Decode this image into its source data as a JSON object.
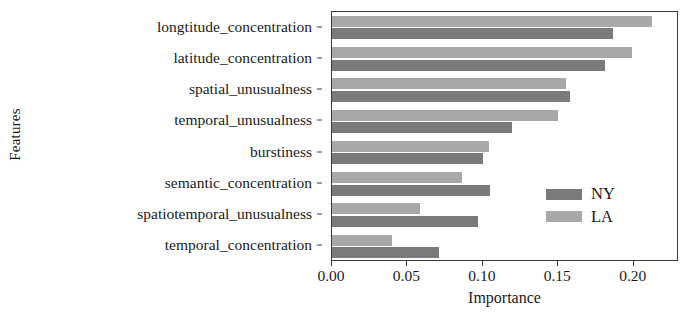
{
  "chart_data": {
    "type": "bar",
    "orientation": "horizontal",
    "title": "",
    "xlabel": "Importance",
    "ylabel": "Features",
    "categories": [
      "longtitude_concentration",
      "latitude_concentration",
      "spatial_unusualness",
      "temporal_unusualness",
      "burstiness",
      "semantic_concentration",
      "spatiotemporal_unusualness",
      "temporal_concentration"
    ],
    "series": [
      {
        "name": "NY",
        "color": "#7a7a7a",
        "values": [
          0.186,
          0.181,
          0.158,
          0.119,
          0.1,
          0.105,
          0.097,
          0.071
        ]
      },
      {
        "name": "LA",
        "color": "#a8a8a8",
        "values": [
          0.212,
          0.199,
          0.155,
          0.15,
          0.104,
          0.086,
          0.058,
          0.04
        ]
      }
    ],
    "xlim": [
      0.0,
      0.23
    ],
    "xticks": [
      0.0,
      0.05,
      0.1,
      0.15,
      0.2
    ],
    "xtick_labels": [
      "0.00",
      "0.05",
      "0.10",
      "0.15",
      "0.20"
    ],
    "grid": false,
    "legend_position": "center right",
    "legend_entries": [
      "NY",
      "LA"
    ]
  }
}
